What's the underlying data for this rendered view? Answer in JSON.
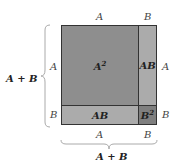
{
  "diagram": {
    "top_labels": {
      "a": "A",
      "b": "B"
    },
    "right_labels": {
      "a": "A",
      "b": "B"
    },
    "left_labels": {
      "a": "A",
      "b": "B"
    },
    "bottom_labels": {
      "a": "A",
      "b": "B"
    },
    "left_brace_label": "A + B",
    "bottom_brace_label": "A + B",
    "regions": {
      "a_squared": {
        "base": "A",
        "exp": "2",
        "color": "#8e8e8e"
      },
      "ab_right": {
        "text": "AB",
        "color": "#ababab"
      },
      "ab_bottom": {
        "text": "AB",
        "color": "#ababab"
      },
      "b_squared": {
        "base": "B",
        "exp": "2",
        "color": "#7f7f7f"
      }
    },
    "border_color": "#333333"
  }
}
